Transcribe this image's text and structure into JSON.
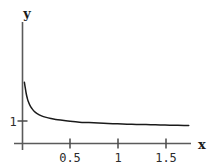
{
  "chart_data": {
    "type": "line",
    "title": "",
    "subtitle": "",
    "xlabel": "x",
    "ylabel": "y",
    "grid": false,
    "legend": null,
    "xlim": [
      0,
      1.75
    ],
    "ylim": [
      0,
      2.75
    ],
    "x_ticks": [
      0.5,
      1,
      1.5
    ],
    "x_tick_labels": [
      "0.5",
      "1",
      "1.5"
    ],
    "y_ticks": [
      1
    ],
    "y_tick_labels": [
      "1"
    ],
    "series": [
      {
        "name": "curve",
        "color": "#1a1a1a",
        "x": [
          0.02,
          0.03,
          0.04,
          0.05,
          0.06,
          0.08,
          0.1,
          0.125,
          0.15,
          0.2,
          0.25,
          0.3,
          0.35,
          0.4,
          0.5,
          0.6,
          0.7,
          0.8,
          0.9,
          1.0,
          1.1,
          1.2,
          1.3,
          1.4,
          1.5,
          1.6,
          1.7,
          1.75
        ],
        "y": [
          2.72,
          2.45,
          2.2,
          2.02,
          1.88,
          1.68,
          1.55,
          1.42,
          1.34,
          1.23,
          1.16,
          1.11,
          1.07,
          1.04,
          0.99,
          0.95,
          0.93,
          0.91,
          0.89,
          0.875,
          0.86,
          0.85,
          0.84,
          0.83,
          0.82,
          0.81,
          0.805,
          0.8
        ]
      }
    ]
  },
  "axes": {
    "x_label": "x",
    "y_label": "y"
  },
  "colors": {
    "curve": "#1a1a1a",
    "axis": "#5a5a5a",
    "text": "#1a1a1a",
    "background": "#ffffff"
  }
}
